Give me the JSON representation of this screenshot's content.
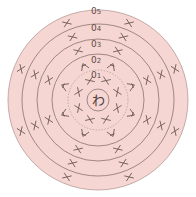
{
  "diagram": {
    "type": "crochet-round-chart",
    "center_label": "わ",
    "colors": {
      "fill": "#f6d6d2",
      "line": "#8a7270",
      "stitch": "#6a5553",
      "dotted": "#b39a97"
    },
    "rounds": [
      {
        "label": "0",
        "num": "1",
        "stitch": "sc",
        "count": 8
      },
      {
        "label": "0",
        "num": "2",
        "stitch": "sc-inc",
        "count": 8
      },
      {
        "label": "0",
        "num": "3",
        "stitch": "sc",
        "count": 8
      },
      {
        "label": "0",
        "num": "4",
        "stitch": "sc",
        "count": 8
      },
      {
        "label": "0",
        "num": "5",
        "stitch": "sc",
        "count": 8
      }
    ]
  }
}
